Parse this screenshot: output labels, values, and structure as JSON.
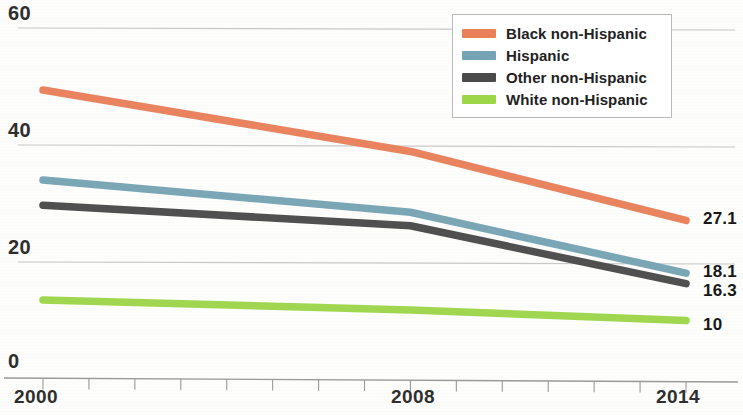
{
  "chart_data": {
    "type": "line",
    "title": "",
    "subtitle": "",
    "xlabel": "",
    "ylabel": "",
    "xlim": [
      2000,
      2014
    ],
    "ylim": [
      0,
      60
    ],
    "grid": true,
    "legend_position": "top-right",
    "x": [
      2000,
      2008,
      2014
    ],
    "y_ticks": [
      "60",
      "40",
      "20",
      "0"
    ],
    "y_tick_values": [
      60,
      40,
      20,
      0
    ],
    "x_ticks": [
      "2000",
      "2008",
      "2014"
    ],
    "x_tick_values": [
      2000,
      2008,
      2014
    ],
    "x_minor_ticks": [
      2000,
      2001,
      2002,
      2003,
      2004,
      2005,
      2006,
      2007,
      2008,
      2009,
      2010,
      2011,
      2012,
      2013,
      2014
    ],
    "series": [
      {
        "name": "Black non-Hispanic",
        "color": "#e8805a",
        "values": [
          49.4,
          38.9,
          27.1
        ],
        "end_label": "27.1"
      },
      {
        "name": "Hispanic",
        "color": "#76a3b4",
        "values": [
          34.0,
          28.5,
          18.1
        ],
        "end_label": "18.1"
      },
      {
        "name": "Other non-Hispanic",
        "color": "#4a4a4a",
        "values": [
          29.7,
          26.2,
          16.3
        ],
        "end_label": "16.3"
      },
      {
        "name": "White non-Hispanic",
        "color": "#9ed64a",
        "values": [
          13.5,
          11.8,
          10.0
        ],
        "end_label": "10"
      }
    ]
  },
  "axis": {
    "y_labels": [
      {
        "text": "60",
        "top": 2
      },
      {
        "text": "40",
        "top": 119
      },
      {
        "text": "20",
        "top": 236
      },
      {
        "text": "0",
        "top": 350
      }
    ],
    "x_labels": [
      {
        "text": "2000",
        "left": 14
      },
      {
        "text": "2008",
        "left": 391
      },
      {
        "text": "2014",
        "left": 656
      }
    ]
  },
  "value_labels": [
    {
      "text": "27.1",
      "left": 703,
      "top": 209
    },
    {
      "text": "18.1",
      "left": 703,
      "top": 262
    },
    {
      "text": "16.3",
      "left": 703,
      "top": 281
    },
    {
      "text": "10",
      "left": 703,
      "top": 315
    }
  ],
  "legend": {
    "items": [
      {
        "label": "Black non-Hispanic",
        "color": "#e8805a"
      },
      {
        "label": "Hispanic",
        "color": "#76a3b4"
      },
      {
        "label": "Other non-Hispanic",
        "color": "#4a4a4a"
      },
      {
        "label": "White non-Hispanic",
        "color": "#9ed64a"
      }
    ]
  },
  "colors": {
    "gridline": "#c8c8c8",
    "axis": "#9a9a9a",
    "text": "#2e2e2e",
    "background": "#fdfdfc"
  }
}
